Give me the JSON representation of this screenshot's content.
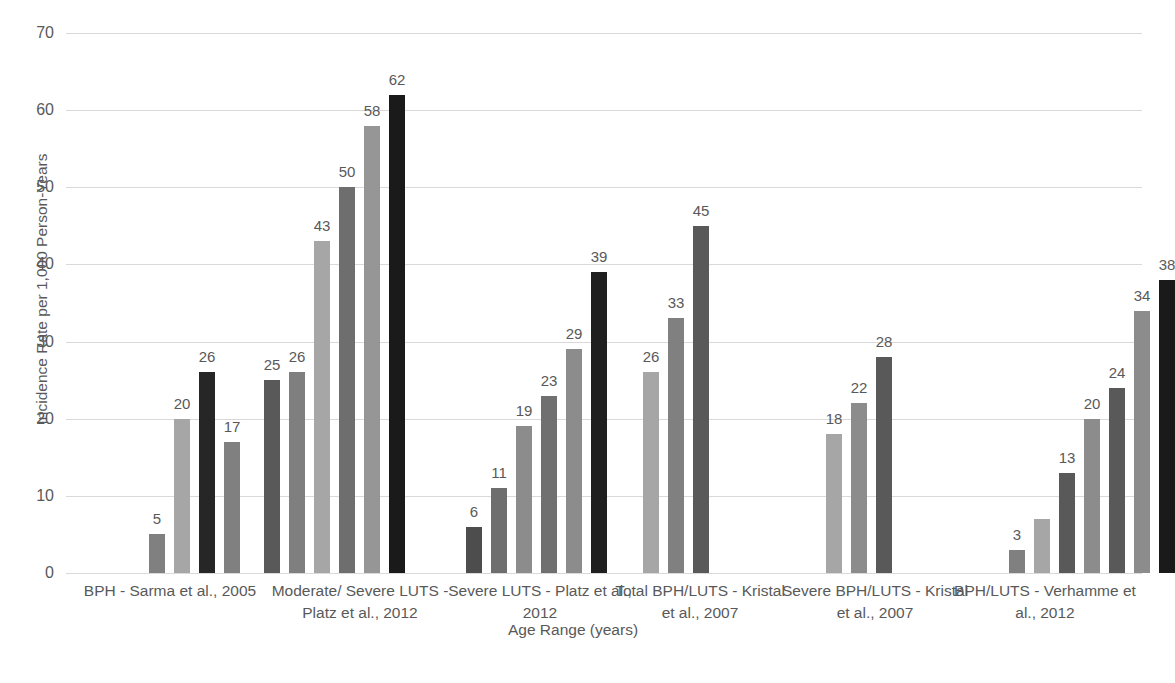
{
  "chart_data": {
    "type": "bar",
    "title": "",
    "xlabel": "Age Range (years)",
    "ylabel": "Incidence Rate per 1,000 Person-Years",
    "ylim": [
      0,
      70
    ],
    "yticks": [
      0,
      10,
      20,
      30,
      40,
      50,
      60,
      70
    ],
    "ytick_labels": [
      "0",
      "10",
      "20",
      "30",
      "40",
      "50",
      "60",
      "70"
    ],
    "grid": true,
    "legend": "none",
    "categories": [
      "BPH - Sarma et al., 2005",
      "Moderate/ Severe LUTS - Platz et al., 2012",
      "Severe LUTS - Platz et al., 2012",
      "Total BPH/LUTS - Kristal et al., 2007",
      "Severe BPH/LUTS - Kristal et al., 2007",
      "BPH/LUTS - Verhamme et al., 2012"
    ],
    "palette": {
      "shade_1": "#a6a6a6",
      "shade_2": "#808080",
      "shade_3": "#bfbfbf",
      "shade_4": "#7f7f7f",
      "shade_5": "#969696",
      "shade_6": "#404040",
      "shade_7": "#262626"
    },
    "groups": [
      {
        "label": "BPH - Sarma et al., 2005",
        "bars": [
          {
            "value": 5,
            "label": "5",
            "color": "#808080"
          },
          {
            "value": 20,
            "label": "20",
            "color": "#a6a6a6"
          },
          {
            "value": 26,
            "label": "26",
            "color": "#262626"
          },
          {
            "value": 17,
            "label": "17",
            "color": "#808080"
          }
        ]
      },
      {
        "label": "Moderate/ Severe LUTS - Platz et al., 2012",
        "bars": [
          {
            "value": 25,
            "label": "25",
            "color": "#595959"
          },
          {
            "value": 26,
            "label": "26",
            "color": "#7f7f7f"
          },
          {
            "value": 43,
            "label": "43",
            "color": "#a6a6a6"
          },
          {
            "value": 50,
            "label": "50",
            "color": "#6e6e6e"
          },
          {
            "value": 58,
            "label": "58",
            "color": "#969696"
          },
          {
            "value": 62,
            "label": "62",
            "color": "#1a1a1a"
          }
        ]
      },
      {
        "label": "Severe LUTS - Platz et al., 2012",
        "bars": [
          {
            "value": 6,
            "label": "6",
            "color": "#4d4d4d"
          },
          {
            "value": 11,
            "label": "11",
            "color": "#6e6e6e"
          },
          {
            "value": 19,
            "label": "19",
            "color": "#8c8c8c"
          },
          {
            "value": 23,
            "label": "23",
            "color": "#707070"
          },
          {
            "value": 29,
            "label": "29",
            "color": "#8c8c8c"
          },
          {
            "value": 39,
            "label": "39",
            "color": "#1f1f1f"
          }
        ]
      },
      {
        "label": "Total BPH/LUTS - Kristal et al., 2007",
        "bars": [
          {
            "value": 26,
            "label": "26",
            "color": "#a6a6a6"
          },
          {
            "value": 33,
            "label": "33",
            "color": "#808080"
          },
          {
            "value": 45,
            "label": "45",
            "color": "#595959"
          }
        ]
      },
      {
        "label": "Severe BPH/LUTS - Kristal et al., 2007",
        "bars": [
          {
            "value": 18,
            "label": "18",
            "color": "#a6a6a6"
          },
          {
            "value": 22,
            "label": "22",
            "color": "#8c8c8c"
          },
          {
            "value": 28,
            "label": "28",
            "color": "#595959"
          }
        ]
      },
      {
        "label": "BPH/LUTS - Verhamme et al., 2012",
        "bars": [
          {
            "value": 3,
            "label": "3",
            "color": "#808080"
          },
          {
            "value": 7,
            "label": "",
            "color": "#a6a6a6"
          },
          {
            "value": 13,
            "label": "13",
            "color": "#595959"
          },
          {
            "value": 20,
            "label": "20",
            "color": "#8c8c8c"
          },
          {
            "value": 24,
            "label": "24",
            "color": "#595959"
          },
          {
            "value": 34,
            "label": "34",
            "color": "#8c8c8c"
          },
          {
            "value": 38,
            "label": "38",
            "color": "#1a1a1a"
          }
        ]
      }
    ],
    "x_group_label_lines": [
      [
        "BPH - Sarma et al., 2005"
      ],
      [
        "Moderate/ Severe LUTS -",
        "Platz et al., 2012"
      ],
      [
        "Severe LUTS - Platz et al.,",
        "2012"
      ],
      [
        "Total BPH/LUTS - Kristal",
        "et al., 2007"
      ],
      [
        "Severe BPH/LUTS - Kristal",
        "et al., 2007"
      ],
      [
        "BPH/LUTS - Verhamme et",
        "al., 2012"
      ]
    ]
  }
}
